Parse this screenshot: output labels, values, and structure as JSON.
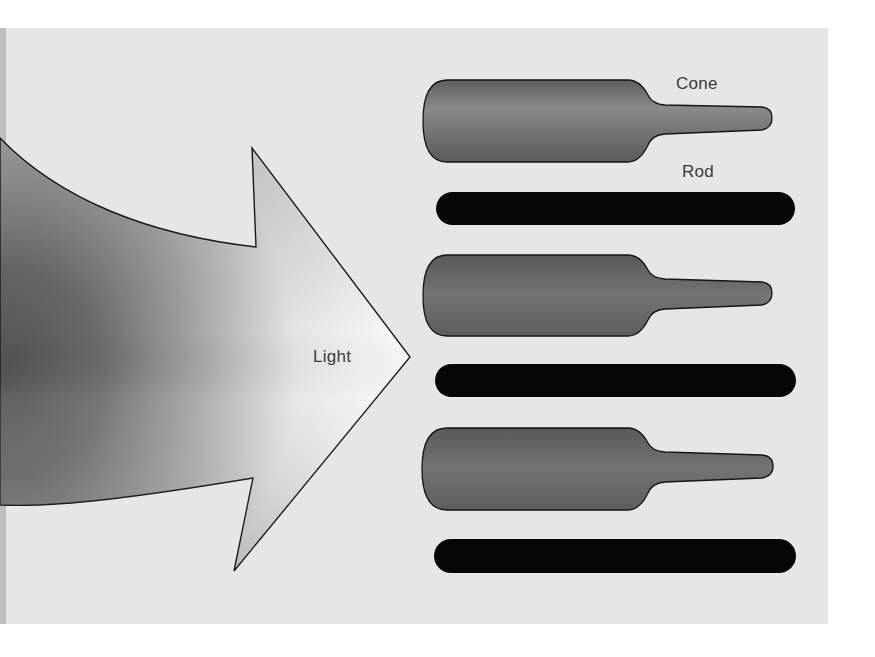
{
  "figure": {
    "labels": {
      "light": "Light",
      "cone": "Cone",
      "rod": "Rod"
    },
    "colors": {
      "background": "#e6e6e6",
      "arrow_dark": "#5a5a5a",
      "arrow_light": "#f6f6f6",
      "cone_fill": "#6b6b6b",
      "cone_highlight": "#8a8a8a",
      "rod_fill": "#050505",
      "outline": "#111111"
    },
    "elements": [
      {
        "type": "arrow",
        "label": "Light",
        "direction": "right"
      },
      {
        "type": "cone",
        "label": "Cone",
        "row": 1
      },
      {
        "type": "rod",
        "label": "Rod",
        "row": 1
      },
      {
        "type": "cone",
        "row": 2
      },
      {
        "type": "rod",
        "row": 2
      },
      {
        "type": "cone",
        "row": 3
      },
      {
        "type": "rod",
        "row": 3
      }
    ]
  }
}
